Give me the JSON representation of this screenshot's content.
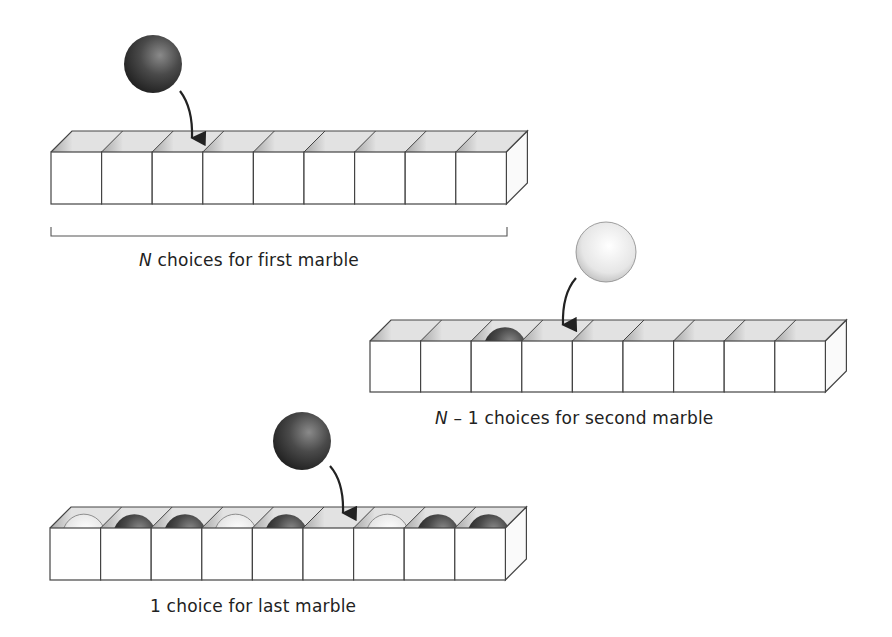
{
  "colors": {
    "background": "#ffffff",
    "stroke": "#444444",
    "top_face": "#e2e2e2",
    "inner_wall": "#c4c4c4",
    "front_face": "#ffffff",
    "dark_marble": "#3a3a3a",
    "light_marble": "#e8e8e8"
  },
  "rows": [
    {
      "id": "first",
      "x": 51,
      "top": 152,
      "depth_dx": 21,
      "depth_dy": 21,
      "cell_w": 50.6,
      "cell_h": 52,
      "cells": 9,
      "slots": [
        "empty",
        "empty",
        "empty",
        "empty",
        "empty",
        "empty",
        "empty",
        "empty",
        "empty"
      ],
      "falling_marble": {
        "color": "dark",
        "cx": 153,
        "cy": 64,
        "r": 29
      },
      "arrow": {
        "from": [
          180,
          91
        ],
        "ctrl": [
          193,
          108
        ],
        "to": [
          192,
          138
        ]
      },
      "bracket": {
        "x1": 51,
        "x2": 507,
        "y": 236
      },
      "caption": {
        "var": "N",
        "text": " choices for first marble",
        "x": 139,
        "y": 250
      }
    },
    {
      "id": "second",
      "x": 370,
      "top": 341,
      "depth_dx": 21,
      "depth_dy": 21,
      "cell_w": 50.6,
      "cell_h": 51,
      "cells": 9,
      "slots": [
        "empty",
        "empty",
        "dark",
        "empty",
        "empty",
        "empty",
        "empty",
        "empty",
        "empty"
      ],
      "falling_marble": {
        "color": "light",
        "cx": 606,
        "cy": 252,
        "r": 30
      },
      "arrow": {
        "from": [
          576,
          278
        ],
        "ctrl": [
          562,
          294
        ],
        "to": [
          563,
          325
        ]
      },
      "caption": {
        "var": "N",
        "text": " – 1 choices for second marble",
        "x": 435,
        "y": 408
      }
    },
    {
      "id": "last",
      "x": 50,
      "top": 528,
      "depth_dx": 21,
      "depth_dy": 21,
      "cell_w": 50.6,
      "cell_h": 52,
      "cells": 9,
      "slots": [
        "light",
        "dark",
        "dark",
        "light",
        "dark",
        "empty",
        "light",
        "dark",
        "dark"
      ],
      "falling_marble": {
        "color": "dark",
        "cx": 302,
        "cy": 441,
        "r": 29
      },
      "arrow": {
        "from": [
          330,
          466
        ],
        "ctrl": [
          344,
          482
        ],
        "to": [
          343,
          513
        ]
      },
      "caption": {
        "var": "",
        "text": "1 choice for last marble",
        "x": 150,
        "y": 596
      }
    }
  ]
}
